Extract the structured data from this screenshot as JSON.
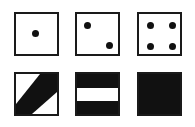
{
  "diagram": {
    "colors": {
      "ink": "#111111",
      "border": "#1a1a1a",
      "background": "#ffffff"
    },
    "row1": [
      {
        "type": "die-face",
        "pips": 1
      },
      {
        "type": "die-face",
        "pips": 2
      },
      {
        "type": "die-face",
        "pips": 4
      }
    ],
    "row2": [
      {
        "type": "diagonal-band",
        "direction": "bottom-left-to-top-right"
      },
      {
        "type": "horizontal-white-stripe"
      },
      {
        "type": "solid-black"
      }
    ]
  }
}
